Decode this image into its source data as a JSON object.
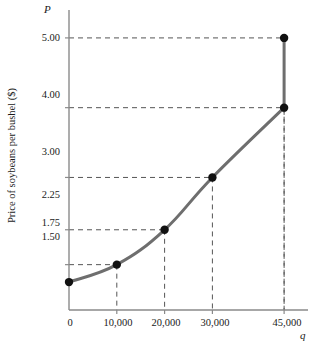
{
  "chart_data": {
    "type": "line",
    "title": "",
    "xlabel": "q",
    "ylabel": "Price of soybeans per bushel ($)",
    "x": [
      0,
      10000,
      20000,
      30000,
      45000,
      45000
    ],
    "values": [
      1.5,
      1.75,
      2.25,
      3.0,
      4.0,
      5.0
    ],
    "series": [
      {
        "name": "Supply curve",
        "points": [
          {
            "q": 0,
            "p": 1.5
          },
          {
            "q": 10000,
            "p": 1.75
          },
          {
            "q": 20000,
            "p": 2.25
          },
          {
            "q": 30000,
            "p": 3.0
          },
          {
            "q": 45000,
            "p": 4.0
          },
          {
            "q": 45000,
            "p": 5.0
          }
        ]
      }
    ],
    "xticks": [
      0,
      10000,
      20000,
      30000,
      45000
    ],
    "xtick_labels": [
      "0",
      "10,000",
      "20,000",
      "30,000",
      "45,000"
    ],
    "yticks": [
      1.5,
      1.75,
      2.25,
      3.0,
      4.0,
      5.0
    ],
    "ytick_labels": [
      "1.50",
      "1.75",
      "2.25",
      "3.00",
      "4.00",
      "5.00"
    ],
    "xlim": [
      0,
      50000
    ],
    "ylim": [
      1.1,
      5.4
    ],
    "grid": false,
    "guide_lines": "dashed",
    "legend": "none",
    "curve_color": "#6e6e6e",
    "marker_color": "#111111",
    "axis_color": "#8a8a8a",
    "guide_color": "#555555"
  },
  "axes": {
    "y_axis_symbol": "P",
    "x_axis_symbol": "q",
    "y_axis_title": "Price of soybeans per bushel ($)"
  }
}
